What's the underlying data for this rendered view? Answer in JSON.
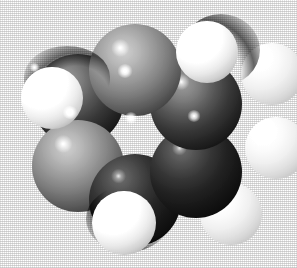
{
  "image": {
    "kind": "space-filling-molecular-model",
    "subject": "benzene",
    "rendering": "CPK space-filling (van der Waals spheres), grayscale halftone print",
    "background_color": "#ffffff",
    "light_direction": "upper-left",
    "width_px": 297,
    "height_px": 268,
    "alt_text": "Grayscale space-filling molecular model of a benzene ring: six dark grey carbon spheres arranged in a hexagon with six white hydrogen spheres around the outside."
  },
  "palette": {
    "background": "#ffffff",
    "carbon_light": "#b4b4b4",
    "carbon_mid": "#5c5c5c",
    "carbon_dark": "#1a1a1a",
    "carbon_shadow": "#070707",
    "hydrogen_light": "#ffffff",
    "hydrogen_mid": "#e2e2e2",
    "hydrogen_shade": "#8c8c8c",
    "specular_highlight": "#ffffff"
  },
  "atoms": [
    {
      "id": "C1",
      "element": "C",
      "label": "carbon",
      "color": "#8a8a8a",
      "tone": "light",
      "cx": 135,
      "cy": 70,
      "r": 46,
      "z": 6
    },
    {
      "id": "C2",
      "element": "C",
      "label": "carbon",
      "color": "#3a3a3a",
      "tone": "mid",
      "cx": 196,
      "cy": 104,
      "r": 46,
      "z": 5
    },
    {
      "id": "C3",
      "element": "C",
      "label": "carbon",
      "color": "#242424",
      "tone": "dark",
      "cx": 196,
      "cy": 172,
      "r": 46,
      "z": 4
    },
    {
      "id": "C4",
      "element": "C",
      "label": "carbon",
      "color": "#2e2e2e",
      "tone": "dark",
      "cx": 135,
      "cy": 200,
      "r": 46,
      "z": 3
    },
    {
      "id": "C5",
      "element": "C",
      "label": "carbon",
      "color": "#8f8f8f",
      "tone": "light",
      "cx": 78,
      "cy": 166,
      "r": 46,
      "z": 2
    },
    {
      "id": "C6",
      "element": "C",
      "label": "carbon",
      "color": "#4a4a4a",
      "tone": "mid",
      "cx": 78,
      "cy": 100,
      "r": 46,
      "z": 1
    },
    {
      "id": "H1",
      "element": "H",
      "label": "hydrogen",
      "color": "#ffffff",
      "tone": "light",
      "cx": 207,
      "cy": 52,
      "r": 31,
      "z": 9
    },
    {
      "id": "H2",
      "element": "H",
      "label": "hydrogen",
      "color": "#ededed",
      "tone": "dim",
      "cx": 272,
      "cy": 74,
      "r": 31,
      "z": 8
    },
    {
      "id": "H3",
      "element": "H",
      "label": "hydrogen",
      "color": "#e6e6e6",
      "tone": "dim",
      "cx": 276,
      "cy": 148,
      "r": 31,
      "z": 7
    },
    {
      "id": "H4",
      "element": "H",
      "label": "hydrogen",
      "color": "#f0f0f0",
      "tone": "dim",
      "cx": 231,
      "cy": 214,
      "r": 31,
      "z": 0
    },
    {
      "id": "H5",
      "element": "H",
      "label": "hydrogen",
      "color": "#ffffff",
      "tone": "light",
      "cx": 124,
      "cy": 223,
      "r": 32,
      "z": 10
    },
    {
      "id": "H6",
      "element": "H",
      "label": "hydrogen",
      "color": "#ffffff",
      "tone": "light",
      "cx": 52,
      "cy": 98,
      "r": 31,
      "z": 11
    }
  ],
  "highlights": [
    {
      "on": "C1",
      "x": 124,
      "y": 71,
      "size": 11
    },
    {
      "on": "C2",
      "x": 193,
      "y": 116,
      "size": 9
    },
    {
      "on": "C5",
      "x": 70,
      "y": 113,
      "size": 10
    },
    {
      "on": "C4",
      "x": 131,
      "y": 118,
      "size": 9
    },
    {
      "on": "C6",
      "x": 34,
      "y": 68,
      "size": 6
    },
    {
      "on": "H5",
      "x": 113,
      "y": 204,
      "size": 7
    }
  ]
}
